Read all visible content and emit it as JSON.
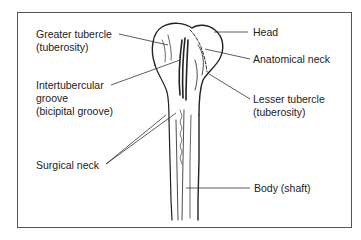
{
  "diagram": {
    "labels": {
      "greater_tubercle": "Greater tubercle",
      "greater_tubercle_alt": "(tuberosity)",
      "intertubercular": "Intertubercular",
      "intertubercular_2": "groove",
      "intertubercular_alt": "(bicipital groove)",
      "surgical_neck": "Surgical neck",
      "head": "Head",
      "anatomical_neck": "Anatomical neck",
      "lesser_tubercle": "Lesser tubercle",
      "lesser_tubercle_alt": "(tuberosity)",
      "body": "Body (shaft)"
    },
    "colors": {
      "line": "#222222",
      "frame": "#555555",
      "background": "#ffffff"
    }
  }
}
